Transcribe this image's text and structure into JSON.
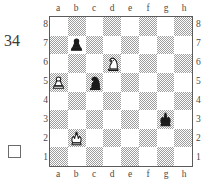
{
  "diagram": {
    "number_label": "34",
    "to_move_indicator": "white-to-move-empty-square",
    "files": [
      "a",
      "b",
      "c",
      "d",
      "e",
      "f",
      "g",
      "h"
    ],
    "ranks": [
      "8",
      "7",
      "6",
      "5",
      "4",
      "3",
      "2",
      "1"
    ],
    "colors": {
      "light_square": "#ffffff",
      "dark_square": "#9d9d9d",
      "border": "#5a5a5a",
      "label_text": "#4a4a4a",
      "number_text": "#3a3a3a",
      "white_piece_fill": "#ffffff",
      "black_piece_fill": "#1a1a1a",
      "piece_outline": "#1a1a1a"
    },
    "pieces": [
      {
        "square": "b7",
        "file": "b",
        "rank": "7",
        "color": "black",
        "type": "pawn",
        "icon": "black-pawn-icon"
      },
      {
        "square": "d6",
        "file": "d",
        "rank": "6",
        "color": "white",
        "type": "knight",
        "icon": "white-knight-icon"
      },
      {
        "square": "a5",
        "file": "a",
        "rank": "5",
        "color": "white",
        "type": "pawn",
        "icon": "white-pawn-icon"
      },
      {
        "square": "c5",
        "file": "c",
        "rank": "5",
        "color": "black",
        "type": "knight",
        "icon": "black-knight-icon"
      },
      {
        "square": "g3",
        "file": "g",
        "rank": "3",
        "color": "black",
        "type": "king",
        "icon": "black-king-icon"
      },
      {
        "square": "b2",
        "file": "b",
        "rank": "2",
        "color": "white",
        "type": "king",
        "icon": "white-king-icon"
      }
    ],
    "fen": "8/1p6/3N4/P1n5/8/6k1/1K6/8 w - - 0 1"
  },
  "chart_data": {
    "type": "table",
    "title": "34",
    "files": [
      "a",
      "b",
      "c",
      "d",
      "e",
      "f",
      "g",
      "h"
    ],
    "ranks": [
      8,
      7,
      6,
      5,
      4,
      3,
      2,
      1
    ],
    "occupancy": [
      {
        "square": "b7",
        "piece": "black pawn"
      },
      {
        "square": "d6",
        "piece": "white knight"
      },
      {
        "square": "a5",
        "piece": "white pawn"
      },
      {
        "square": "c5",
        "piece": "black knight"
      },
      {
        "square": "g3",
        "piece": "black king"
      },
      {
        "square": "b2",
        "piece": "white king"
      }
    ],
    "side_to_move": "white",
    "grid": true,
    "legend_position": "none"
  }
}
